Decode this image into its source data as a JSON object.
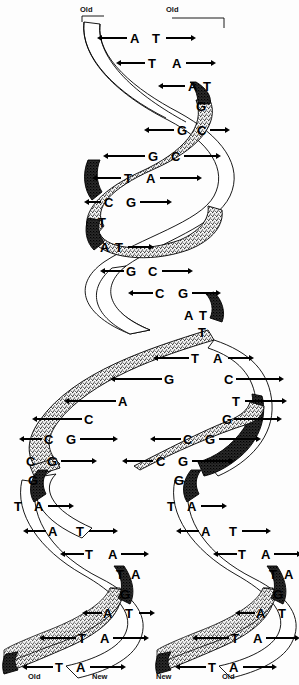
{
  "figure": {
    "colors": {
      "ink": "#000000",
      "background": "#fdfdfd",
      "ribbon_light": "#ffffff",
      "ribbon_stipple": "#9a9a9a",
      "ribbon_dark": "#1a1a1a"
    }
  },
  "end_labels": {
    "top_left": "Old",
    "top_right": "Old",
    "bottom_1": "Old",
    "bottom_2": "New",
    "bottom_3": "New",
    "bottom_4": "Old"
  },
  "stem": {
    "name": "parental-duplex",
    "pairs": [
      {
        "left": "A",
        "right": "T",
        "x_left": 130,
        "x_right": 152,
        "y": 32,
        "rung_left": {
          "x": 101,
          "w": 26,
          "dir": "l"
        },
        "rung_right": {
          "x": 166,
          "w": 26,
          "dir": "r"
        }
      },
      {
        "left": "T",
        "right": "A",
        "x_left": 148,
        "x_right": 172,
        "y": 57,
        "rung_left": {
          "x": 120,
          "w": 25,
          "dir": "l"
        },
        "rung_right": {
          "x": 186,
          "w": 26,
          "dir": "r"
        }
      },
      {
        "left": "A",
        "right": "T",
        "x_left": 188,
        "x_right": 203,
        "y": 80,
        "rung_left": {
          "x": 162,
          "w": 23,
          "dir": "l"
        },
        "rung_right": null
      },
      {
        "left": "",
        "right": "G",
        "x_left": 0,
        "x_right": 196,
        "y": 100,
        "rung_left": null,
        "rung_right": null
      },
      {
        "left": "G",
        "right": "C",
        "x_left": 177,
        "x_right": 197,
        "y": 124,
        "rung_left": {
          "x": 148,
          "w": 26,
          "dir": "l"
        },
        "rung_right": {
          "x": 210,
          "w": 16,
          "dir": "r"
        }
      },
      {
        "left": "G",
        "right": "C",
        "x_left": 148,
        "x_right": 171,
        "y": 150,
        "rung_left": {
          "x": 107,
          "w": 38,
          "dir": "l"
        },
        "rung_right": {
          "x": 184,
          "w": 33,
          "dir": "r"
        }
      },
      {
        "left": "T",
        "right": "A",
        "x_left": 124,
        "x_right": 146,
        "y": 172,
        "rung_left": {
          "x": 96,
          "w": 25,
          "dir": "l"
        },
        "rung_right": {
          "x": 160,
          "w": 38,
          "dir": "r"
        }
      },
      {
        "left": "C",
        "right": "G",
        "x_left": 104,
        "x_right": 126,
        "y": 196,
        "rung_left": {
          "x": 88,
          "w": 13,
          "dir": "l"
        },
        "rung_right": {
          "x": 140,
          "w": 28,
          "dir": "r"
        }
      },
      {
        "left": "T",
        "right": "",
        "x_left": 98,
        "x_right": 0,
        "y": 216,
        "rung_left": null,
        "rung_right": null
      },
      {
        "left": "A",
        "right": "T",
        "x_left": 100,
        "x_right": 115,
        "y": 241,
        "rung_left": null,
        "rung_right": {
          "x": 128,
          "w": 22,
          "dir": "r"
        }
      },
      {
        "left": "G",
        "right": "C",
        "x_left": 126,
        "x_right": 148,
        "y": 265,
        "rung_left": {
          "x": 104,
          "w": 20,
          "dir": "l"
        },
        "rung_right": {
          "x": 162,
          "w": 27,
          "dir": "r"
        }
      },
      {
        "left": "C",
        "right": "G",
        "x_left": 155,
        "x_right": 178,
        "y": 287,
        "rung_left": {
          "x": 132,
          "w": 21,
          "dir": "l"
        },
        "rung_right": {
          "x": 192,
          "w": 25,
          "dir": "r"
        }
      },
      {
        "left": "A",
        "right": "T",
        "x_left": 184,
        "x_right": 199,
        "y": 309,
        "rung_left": null,
        "rung_right": null
      },
      {
        "left": "",
        "right": "T",
        "x_left": 0,
        "x_right": 198,
        "y": 326,
        "rung_left": null,
        "rung_right": null
      }
    ]
  },
  "fork": {
    "name": "replication-fork-loop",
    "left_arm_pairs": [
      {
        "left": "T",
        "right": "A",
        "x_left": 191,
        "x_right": 213,
        "y": 352,
        "rung_left": {
          "x": 157,
          "w": 32,
          "dir": "l"
        },
        "rung_right": {
          "x": 228,
          "w": 22,
          "dir": "r"
        }
      },
      {
        "left": "G",
        "right": "C",
        "x_left": 164,
        "x_right": 224,
        "y": 373,
        "rung_left": {
          "x": 114,
          "w": 48,
          "dir": "l"
        },
        "rung_right": {
          "x": 236,
          "w": 44,
          "dir": "r"
        }
      },
      {
        "left": "A",
        "right": "T",
        "x_left": 118,
        "x_right": 232,
        "y": 395,
        "rung_left": {
          "x": 68,
          "w": 48,
          "dir": "l"
        },
        "rung_right": {
          "x": 245,
          "w": 38,
          "dir": "r"
        }
      },
      {
        "left": "C",
        "right": "G",
        "x_left": 84,
        "x_right": 222,
        "y": 413,
        "rung_left": {
          "x": 36,
          "w": 46,
          "dir": "l"
        },
        "rung_right": {
          "x": 234,
          "w": 44,
          "dir": "r"
        }
      },
      {
        "left": "C",
        "right": "G",
        "x_left": 44,
        "x_right": 66,
        "y": 433,
        "rung_left": {
          "x": 23,
          "w": 19,
          "dir": "l"
        },
        "rung_right": {
          "x": 80,
          "w": 34,
          "dir": "r"
        }
      },
      {
        "left": "C",
        "right": "G",
        "x_left": 26,
        "x_right": 47,
        "y": 455,
        "rung_left": null,
        "rung_right": {
          "x": 61,
          "w": 32,
          "dir": "r"
        }
      },
      {
        "left": "G",
        "right": "",
        "x_left": 28,
        "x_right": 0,
        "y": 474,
        "rung_left": null,
        "rung_right": null
      }
    ],
    "right_arm_pairs": [
      {
        "left": "C",
        "right": "G",
        "x_left": 183,
        "x_right": 205,
        "y": 433,
        "rung_left": {
          "x": 154,
          "w": 27,
          "dir": "l"
        },
        "rung_right": {
          "x": 219,
          "w": 38,
          "dir": "r"
        }
      },
      {
        "left": "C",
        "right": "G",
        "x_left": 156,
        "x_right": 178,
        "y": 455,
        "rung_left": {
          "x": 126,
          "w": 27,
          "dir": "l"
        },
        "rung_right": {
          "x": 192,
          "w": 38,
          "dir": "r"
        }
      },
      {
        "left": "G",
        "right": "",
        "x_left": 174,
        "x_right": 0,
        "y": 474,
        "rung_left": null,
        "rung_right": null
      }
    ]
  },
  "daughter_left": {
    "name": "daughter-duplex-left",
    "pairs": [
      {
        "left": "T",
        "right": "A",
        "x_left": 14,
        "x_right": 34,
        "y": 500,
        "rung_left": null,
        "rung_right": {
          "x": 48,
          "w": 22,
          "dir": "r"
        }
      },
      {
        "left": "A",
        "right": "T",
        "x_left": 48,
        "x_right": 76,
        "y": 525,
        "rung_left": {
          "x": 27,
          "w": 19,
          "dir": "l"
        },
        "rung_right": {
          "x": 89,
          "w": 25,
          "dir": "r"
        }
      },
      {
        "left": "T",
        "right": "A",
        "x_left": 85,
        "x_right": 108,
        "y": 548,
        "rung_left": {
          "x": 64,
          "w": 20,
          "dir": "l"
        },
        "rung_right": {
          "x": 121,
          "w": 24,
          "dir": "r"
        }
      },
      {
        "left": "T",
        "right": "A",
        "x_left": 116,
        "x_right": 131,
        "y": 568,
        "rung_left": null,
        "rung_right": null
      },
      {
        "left": "",
        "right": "G",
        "x_left": 0,
        "x_right": 120,
        "y": 588,
        "rung_left": null,
        "rung_right": null
      },
      {
        "left": "A",
        "right": "T",
        "x_left": 103,
        "x_right": 125,
        "y": 607,
        "rung_left": {
          "x": 86,
          "w": 16,
          "dir": "l"
        },
        "rung_right": {
          "x": 139,
          "w": 12,
          "dir": "r"
        }
      },
      {
        "left": "T",
        "right": "A",
        "x_left": 78,
        "x_right": 100,
        "y": 632,
        "rung_left": {
          "x": 43,
          "w": 33,
          "dir": "l"
        },
        "rung_right": {
          "x": 113,
          "w": 32,
          "dir": "r"
        }
      },
      {
        "left": "T",
        "right": "A",
        "x_left": 55,
        "x_right": 76,
        "y": 661,
        "rung_left": {
          "x": 26,
          "w": 27,
          "dir": "l"
        },
        "rung_right": {
          "x": 90,
          "w": 32,
          "dir": "r"
        }
      }
    ]
  },
  "daughter_right": {
    "name": "daughter-duplex-right",
    "pairs": [
      {
        "left": "T",
        "right": "A",
        "x_left": 167,
        "x_right": 187,
        "y": 500,
        "rung_left": null,
        "rung_right": {
          "x": 201,
          "w": 22,
          "dir": "r"
        }
      },
      {
        "left": "A",
        "right": "T",
        "x_left": 201,
        "x_right": 229,
        "y": 525,
        "rung_left": {
          "x": 180,
          "w": 19,
          "dir": "l"
        },
        "rung_right": {
          "x": 242,
          "w": 25,
          "dir": "r"
        }
      },
      {
        "left": "T",
        "right": "A",
        "x_left": 238,
        "x_right": 261,
        "y": 548,
        "rung_left": {
          "x": 217,
          "w": 20,
          "dir": "l"
        },
        "rung_right": {
          "x": 274,
          "w": 24,
          "dir": "r"
        }
      },
      {
        "left": "T",
        "right": "A",
        "x_left": 269,
        "x_right": 284,
        "y": 568,
        "rung_left": null,
        "rung_right": null
      },
      {
        "left": "",
        "right": "G",
        "x_left": 0,
        "x_right": 273,
        "y": 588,
        "rung_left": null,
        "rung_right": null
      },
      {
        "left": "A",
        "right": "T",
        "x_left": 256,
        "x_right": 278,
        "y": 607,
        "rung_left": {
          "x": 239,
          "w": 16,
          "dir": "l"
        },
        "rung_right": null
      },
      {
        "left": "T",
        "right": "A",
        "x_left": 231,
        "x_right": 253,
        "y": 632,
        "rung_left": {
          "x": 196,
          "w": 33,
          "dir": "l"
        },
        "rung_right": {
          "x": 266,
          "w": 30,
          "dir": "r"
        }
      },
      {
        "left": "T",
        "right": "A",
        "x_left": 208,
        "x_right": 229,
        "y": 661,
        "rung_left": {
          "x": 179,
          "w": 27,
          "dir": "l"
        },
        "rung_right": {
          "x": 243,
          "w": 30,
          "dir": "r"
        }
      }
    ]
  }
}
